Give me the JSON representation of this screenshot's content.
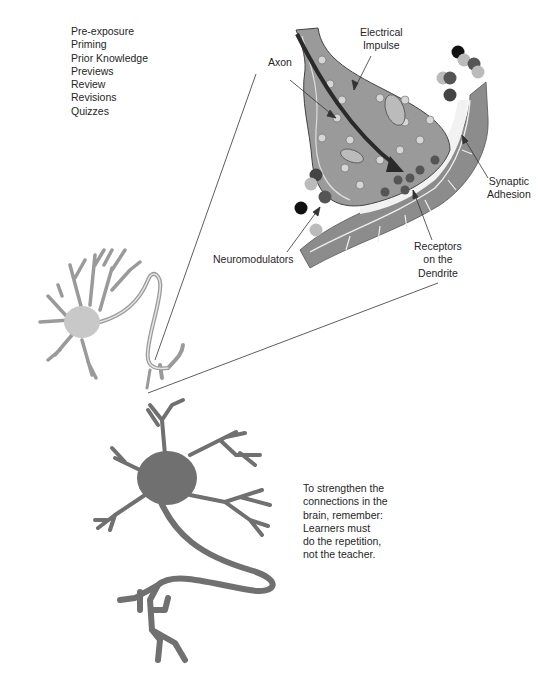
{
  "reinforcement_list": {
    "items": [
      "Pre-exposure",
      "Priming",
      "Prior Knowledge",
      "Previews",
      "Review",
      "Revisions",
      "Quizzes"
    ]
  },
  "labels": {
    "axon": "Axon",
    "electrical_impulse": [
      "Electrical",
      "Impulse"
    ],
    "synaptic_adhesion": [
      "Synaptic",
      "Adhesion"
    ],
    "neuromodulators": "Neuromodulators",
    "receptors": [
      "Receptors",
      "on the",
      "Dendrite"
    ]
  },
  "note": {
    "lines": [
      "To strengthen the",
      "connections in the",
      "brain, remember:",
      "Learners must",
      "do the repetition,",
      "not the teacher."
    ]
  },
  "colors": {
    "synapse_fill": "#9a9a9a",
    "dendrite_fill": "#8c8c8c",
    "small_neuron_fill": "#c8c8c8",
    "large_neuron_fill": "#707070",
    "impulse_arrow": "#2a2a2a",
    "gap_fill": "#f2f2f2"
  }
}
